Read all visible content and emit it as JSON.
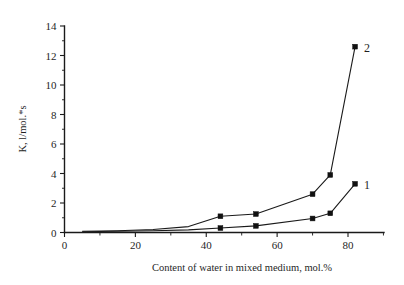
{
  "chart_data": {
    "type": "line",
    "title": "",
    "xlabel": "Content of water in mixed medium, mol.%",
    "ylabel": "K, l/mol.*s",
    "xlim": [
      0,
      90
    ],
    "ylim": [
      0,
      14
    ],
    "xticks": [
      0,
      10,
      20,
      30,
      40,
      50,
      60,
      70,
      80,
      90
    ],
    "xtick_labels": [
      "0",
      "",
      "20",
      "",
      "40",
      "",
      "60",
      "",
      "80",
      ""
    ],
    "yticks": [
      0,
      1,
      2,
      3,
      4,
      5,
      6,
      7,
      8,
      9,
      10,
      11,
      12,
      13,
      14
    ],
    "ytick_labels": [
      "0",
      "",
      "2",
      "",
      "4",
      "",
      "6",
      "",
      "8",
      "",
      "10",
      "",
      "12",
      "",
      "14"
    ],
    "grid": false,
    "legend": "inline-end-labels",
    "marker": "filled-square",
    "line_color": "#1a1a1a",
    "series": [
      {
        "name": "1",
        "label": "1",
        "x": [
          5,
          15,
          25,
          35,
          44,
          54,
          70,
          75,
          82
        ],
        "y": [
          0.05,
          0.08,
          0.12,
          0.18,
          0.3,
          0.45,
          0.95,
          1.3,
          3.3
        ]
      },
      {
        "name": "2",
        "label": "2",
        "x": [
          5,
          15,
          25,
          35,
          44,
          54,
          70,
          75,
          82
        ],
        "y": [
          0.08,
          0.12,
          0.2,
          0.4,
          1.1,
          1.25,
          2.6,
          3.9,
          12.6
        ]
      }
    ]
  },
  "axes": {
    "y_axis_title": "K, l/mol.*s",
    "x_axis_title": "Content of water in mixed medium, mol.%"
  },
  "labels": {
    "series_one": "1",
    "series_two": "2"
  }
}
